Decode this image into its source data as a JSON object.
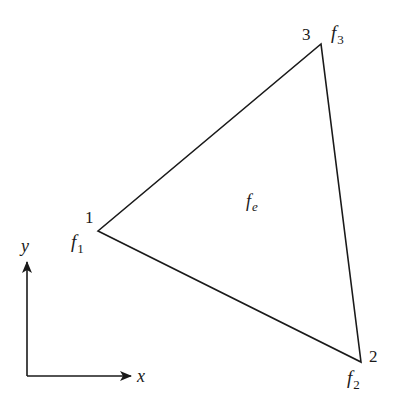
{
  "diagram": {
    "type": "triangular-element",
    "colors": {
      "stroke": "#1a1a1a",
      "background": "#ffffff"
    },
    "vertices": [
      {
        "id": "1",
        "number_label": "1",
        "func_label": "f",
        "func_sub": "1",
        "x": 98,
        "y": 231
      },
      {
        "id": "2",
        "number_label": "2",
        "func_label": "f",
        "func_sub": "2",
        "x": 361,
        "y": 362
      },
      {
        "id": "3",
        "number_label": "3",
        "func_label": "f",
        "func_sub": "3",
        "x": 321,
        "y": 44
      }
    ],
    "element_label": {
      "func": "f",
      "sub": "e"
    },
    "axes": {
      "x_label": "x",
      "y_label": "y"
    }
  }
}
